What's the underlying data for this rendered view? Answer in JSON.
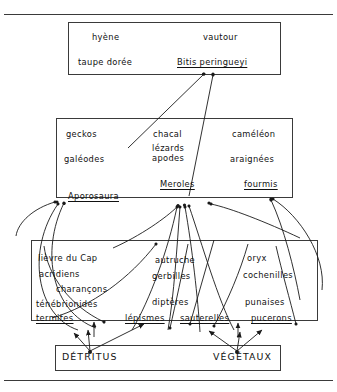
{
  "diagram": {
    "type": "food-web",
    "frame": {
      "top_rule": true,
      "bottom_rule": true,
      "line_color": "#3a3a3a"
    },
    "levels": [
      {
        "id": "predators-top",
        "name": "top-predator-box",
        "items": [
          {
            "id": "hyene",
            "label": "hyène",
            "underline": false
          },
          {
            "id": "vautour",
            "label": "vautour",
            "underline": false
          },
          {
            "id": "taupe-doree",
            "label": "taupe dorée",
            "underline": false
          },
          {
            "id": "bitis-peringueyi",
            "label": "Bitis peringueyi",
            "underline": true
          }
        ]
      },
      {
        "id": "predators-mid",
        "name": "secondary-consumer-box",
        "items": [
          {
            "id": "geckos",
            "label": "geckos",
            "underline": false
          },
          {
            "id": "chacal",
            "label": "chacal",
            "underline": false
          },
          {
            "id": "cameleon",
            "label": "caméléon",
            "underline": false
          },
          {
            "id": "lezards-apodes",
            "label": "lézards\napodes",
            "underline": false
          },
          {
            "id": "galeodes",
            "label": "galéodes",
            "underline": false
          },
          {
            "id": "araignees",
            "label": "araignées",
            "underline": false
          },
          {
            "id": "meroles",
            "label": "Meroles",
            "underline": true
          },
          {
            "id": "fourmis",
            "label": "fourmis",
            "underline": true
          },
          {
            "id": "aporosaura",
            "label": "Aporosaura",
            "underline": true
          }
        ]
      },
      {
        "id": "consumers-primary",
        "name": "primary-consumer-box",
        "items": [
          {
            "id": "lievre-du-cap",
            "label": "lièvre du Cap",
            "underline": false
          },
          {
            "id": "acridiens",
            "label": "acridiens",
            "underline": false
          },
          {
            "id": "charancons",
            "label": "charançons",
            "underline": false
          },
          {
            "id": "tenebrionides",
            "label": "ténébrionides",
            "underline": false
          },
          {
            "id": "autruche",
            "label": "autruche",
            "underline": false
          },
          {
            "id": "gerbilles",
            "label": "gerbilles",
            "underline": false
          },
          {
            "id": "dipteres",
            "label": "diptères",
            "underline": false
          },
          {
            "id": "oryx",
            "label": "oryx",
            "underline": false
          },
          {
            "id": "cochenilles",
            "label": "cochenilles",
            "underline": false
          },
          {
            "id": "punaises",
            "label": "punaises",
            "underline": false
          },
          {
            "id": "termites",
            "label": "termites",
            "underline": true
          },
          {
            "id": "lepismes",
            "label": "lépismes",
            "underline": true
          },
          {
            "id": "sauterelles",
            "label": "sauterelles",
            "underline": true
          },
          {
            "id": "pucerons",
            "label": "pucerons",
            "underline": true
          }
        ]
      },
      {
        "id": "base-resources",
        "name": "resource-box",
        "items": [
          {
            "id": "detritus",
            "label": "DÉTRITUS",
            "underline": false
          },
          {
            "id": "vegetaux",
            "label": "VÉGÉTAUX",
            "underline": false
          }
        ]
      }
    ]
  }
}
